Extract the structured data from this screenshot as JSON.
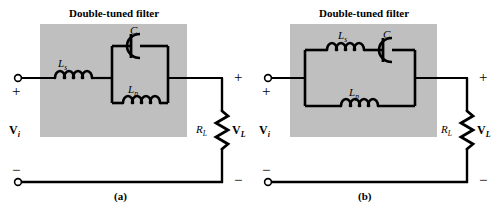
{
  "figure": {
    "type": "circuit-diagram",
    "background_color": "#ffffff",
    "wire_color": "#000000",
    "filter_box_color": "#bfbfbf"
  },
  "panels": [
    {
      "id": "a",
      "caption": "(a)",
      "title": "Double-tuned filter",
      "input": {
        "source_label": "V",
        "source_sub": "i",
        "plus_sign": "+",
        "minus_sign": "−"
      },
      "output": {
        "load_label": "R",
        "load_sub": "L",
        "voltage_label": "V",
        "voltage_sub": "L",
        "plus_sign": "+",
        "minus_sign": "−"
      },
      "components": [
        {
          "name": "series-inductor",
          "label": "L",
          "sub": "s",
          "kind": "inductor",
          "branch": "series"
        },
        {
          "name": "parallel-capacitor",
          "label": "C",
          "sub": "",
          "kind": "capacitor",
          "branch": "tank-top"
        },
        {
          "name": "parallel-inductor",
          "label": "L",
          "sub": "p",
          "kind": "inductor",
          "branch": "tank-bottom"
        }
      ]
    },
    {
      "id": "b",
      "caption": "(b)",
      "title": "Double-tuned filter",
      "input": {
        "source_label": "V",
        "source_sub": "i",
        "plus_sign": "+",
        "minus_sign": "−"
      },
      "output": {
        "load_label": "R",
        "load_sub": "L",
        "voltage_label": "V",
        "voltage_sub": "L",
        "plus_sign": "+",
        "minus_sign": "−"
      },
      "components": [
        {
          "name": "series-inductor",
          "label": "L",
          "sub": "s",
          "kind": "inductor",
          "branch": "tank-top"
        },
        {
          "name": "series-capacitor",
          "label": "C",
          "sub": "",
          "kind": "capacitor",
          "branch": "tank-top"
        },
        {
          "name": "parallel-inductor",
          "label": "L",
          "sub": "p",
          "kind": "inductor",
          "branch": "tank-bottom"
        }
      ]
    }
  ]
}
